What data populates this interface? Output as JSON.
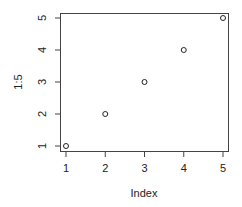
{
  "chart_data": {
    "type": "scatter",
    "title": "",
    "xlabel": "Index",
    "ylabel": "1:5",
    "x": [
      1,
      2,
      3,
      4,
      5
    ],
    "y": [
      1,
      2,
      3,
      4,
      5
    ],
    "series": [
      {
        "name": "1:5",
        "x": [
          1,
          2,
          3,
          4,
          5
        ],
        "y": [
          1,
          2,
          3,
          4,
          5
        ],
        "marker": "open-circle"
      }
    ],
    "xticks": [
      "1",
      "2",
      "3",
      "4",
      "5"
    ],
    "yticks": [
      "1",
      "2",
      "3",
      "4",
      "5"
    ],
    "xlim": [
      1,
      5
    ],
    "ylim": [
      1,
      5
    ],
    "grid": false,
    "legend": "none"
  },
  "labels": {
    "xlabel": "Index",
    "ylabel": "1:5",
    "xticks": [
      "1",
      "2",
      "3",
      "4",
      "5"
    ],
    "yticks": [
      "1",
      "2",
      "3",
      "4",
      "5"
    ]
  }
}
